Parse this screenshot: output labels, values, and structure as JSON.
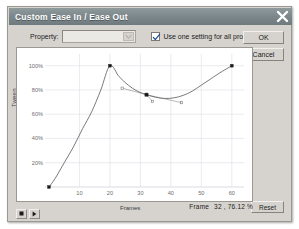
{
  "window": {
    "title": "Custom Ease In / Ease Out",
    "close_icon": "close-x-icon"
  },
  "property_row": {
    "label": "Property:",
    "select_value": "",
    "dropdown_icon": "chevron-down-icon",
    "checkbox_label": "Use one setting for all properties",
    "checkbox_checked": true,
    "check_icon": "check-mark-icon"
  },
  "buttons": {
    "ok": "OK",
    "cancel": "Cancel",
    "reset": "Reset"
  },
  "transport": {
    "stop_icon": "stop-square-icon",
    "play_icon": "play-triangle-icon"
  },
  "status": {
    "frame_label": "Frame",
    "frame_value": "32 , 76.12 %"
  },
  "colors": {
    "titlebar": "#7d898c",
    "dialog_face": "#d6d3ce",
    "curve": "#6b6b6b",
    "grid": "#e3e3ea",
    "axis_text": "#6d6d6d",
    "point_fill": "#1a1a1a",
    "handle_line": "#8a8a8a"
  },
  "chart_data": {
    "type": "line",
    "title": "",
    "xlabel": "Frames",
    "ylabel": "Tween",
    "xlim": [
      0,
      64
    ],
    "ylim": [
      0,
      108
    ],
    "grid": true,
    "legend": "none",
    "xticks": [
      10,
      20,
      30,
      40,
      50,
      60
    ],
    "xtick_labels": [
      "10",
      "20",
      "30",
      "40",
      "50",
      "60"
    ],
    "yticks": [
      20,
      40,
      60,
      80,
      100
    ],
    "ytick_labels": [
      "20%",
      "40%",
      "60%",
      "80%",
      "100%"
    ],
    "curve_points": [
      {
        "x": 0,
        "y": 0
      },
      {
        "x": 2,
        "y": 7
      },
      {
        "x": 5,
        "y": 20
      },
      {
        "x": 8,
        "y": 33
      },
      {
        "x": 11,
        "y": 48
      },
      {
        "x": 14,
        "y": 62
      },
      {
        "x": 17,
        "y": 80
      },
      {
        "x": 20,
        "y": 100
      },
      {
        "x": 23,
        "y": 91
      },
      {
        "x": 26,
        "y": 84
      },
      {
        "x": 29,
        "y": 79
      },
      {
        "x": 32,
        "y": 76.12
      },
      {
        "x": 35,
        "y": 74
      },
      {
        "x": 38,
        "y": 73
      },
      {
        "x": 41,
        "y": 73.5
      },
      {
        "x": 44,
        "y": 75.5
      },
      {
        "x": 47,
        "y": 79
      },
      {
        "x": 50,
        "y": 84
      },
      {
        "x": 53,
        "y": 89
      },
      {
        "x": 56,
        "y": 94
      },
      {
        "x": 60,
        "y": 100
      }
    ],
    "control_points": [
      {
        "name": "start",
        "x": 0,
        "y": 0,
        "selected": false
      },
      {
        "name": "peak",
        "x": 20,
        "y": 100,
        "selected": false
      },
      {
        "name": "selected",
        "x": 32,
        "y": 76.12,
        "selected": true
      },
      {
        "name": "end",
        "x": 60,
        "y": 100,
        "selected": false
      }
    ],
    "tangent_handles": [
      {
        "from_x": 32,
        "from_y": 76.12,
        "to_x": 24,
        "to_y": 81.5
      },
      {
        "from_x": 32,
        "from_y": 76.12,
        "to_x": 43.5,
        "to_y": 69.5
      },
      {
        "from_x": 32,
        "from_y": 76.12,
        "to_x": 34,
        "to_y": 70.5
      }
    ]
  }
}
